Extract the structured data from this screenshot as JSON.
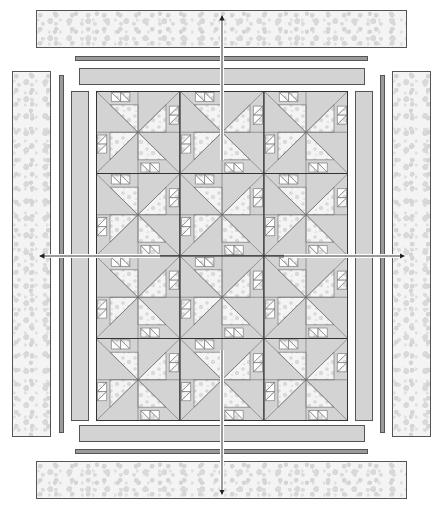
{
  "diagram": {
    "canvas": {
      "width": 444,
      "height": 510,
      "background": "#ffffff"
    },
    "colors": {
      "floral_base": "#f4f4f4",
      "floral_dots": "#d6d6d6",
      "solid_light": "#d3d3d3",
      "solid_dark": "#9a9a9a",
      "outline": "#555555",
      "arrow": "#222222"
    },
    "borders": {
      "outer": [
        {
          "side": "top",
          "fabric": "floral",
          "x": 36,
          "y": 10,
          "w": 371,
          "h": 38
        },
        {
          "side": "bottom",
          "fabric": "floral",
          "x": 36,
          "y": 461,
          "w": 371,
          "h": 38
        },
        {
          "side": "left",
          "fabric": "floral",
          "x": 12,
          "y": 71,
          "w": 39,
          "h": 366
        },
        {
          "side": "right",
          "fabric": "floral",
          "x": 392,
          "y": 71,
          "w": 39,
          "h": 366
        }
      ],
      "middle_thin": [
        {
          "side": "top",
          "fabric": "solid_dark",
          "x": 75,
          "y": 56,
          "w": 293,
          "h": 5
        },
        {
          "side": "bottom",
          "fabric": "solid_dark",
          "x": 75,
          "y": 449,
          "w": 293,
          "h": 5
        },
        {
          "side": "left",
          "fabric": "solid_dark",
          "x": 59,
          "y": 75,
          "w": 5,
          "h": 358
        },
        {
          "side": "right",
          "fabric": "solid_dark",
          "x": 380,
          "y": 75,
          "w": 5,
          "h": 358
        }
      ],
      "inner": [
        {
          "side": "top",
          "fabric": "solid_light",
          "x": 79,
          "y": 68,
          "w": 286,
          "h": 17
        },
        {
          "side": "bottom",
          "fabric": "solid_light",
          "x": 79,
          "y": 425,
          "w": 286,
          "h": 17
        },
        {
          "side": "left",
          "fabric": "solid_light",
          "x": 71,
          "y": 91,
          "w": 18,
          "h": 330
        },
        {
          "side": "right",
          "fabric": "solid_light",
          "x": 355,
          "y": 91,
          "w": 18,
          "h": 330
        }
      ]
    },
    "center": {
      "x": 96,
      "y": 91,
      "w": 252,
      "h": 330,
      "rows": 4,
      "cols": 3,
      "block_pattern": "pinwheel with sawtooth triangles",
      "block_size": {
        "w": 84,
        "h": 82.5
      }
    },
    "arrows": [
      {
        "direction": "up",
        "from": [
          222,
          160
        ],
        "to": [
          222,
          16
        ]
      },
      {
        "direction": "down",
        "from": [
          222,
          350
        ],
        "to": [
          222,
          494
        ]
      },
      {
        "direction": "left",
        "from": [
          160,
          256
        ],
        "to": [
          40,
          256
        ]
      },
      {
        "direction": "right",
        "from": [
          284,
          256
        ],
        "to": [
          404,
          256
        ]
      }
    ]
  }
}
